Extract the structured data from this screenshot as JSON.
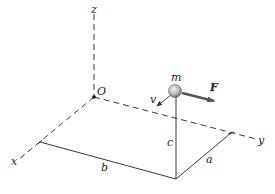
{
  "figure": {
    "type": "3d-coordinate-diagram",
    "axes": {
      "x": {
        "label": "x"
      },
      "y": {
        "label": "y"
      },
      "z": {
        "label": "z"
      },
      "origin": {
        "label": "O"
      }
    },
    "particle": {
      "label": "m"
    },
    "force": {
      "label": "F"
    },
    "velocity": {
      "label": "v"
    },
    "dimensions": {
      "a": {
        "label": "a"
      },
      "b": {
        "label": "b"
      },
      "c": {
        "label": "c"
      }
    },
    "colors": {
      "line": "#222222",
      "force_arrow": "#555555",
      "particle_fill": "#b8b8b8"
    }
  }
}
